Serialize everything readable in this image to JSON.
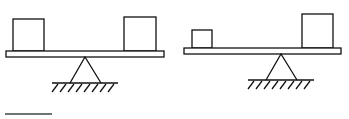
{
  "diagram": {
    "colors": {
      "stroke": "#111111",
      "background": "#ffffff"
    },
    "scenes": [
      {
        "name": "balanced-seesaw",
        "beam": {
          "x": 6,
          "y": 51,
          "w": 158,
          "h": 6
        },
        "left_box": {
          "x": 13,
          "y": 19,
          "w": 31,
          "h": 32
        },
        "right_box": {
          "x": 124,
          "y": 17,
          "w": 32,
          "h": 34
        },
        "fulcrum": {
          "apex_x": 85,
          "apex_y": 57,
          "base_left": 70,
          "base_right": 101,
          "base_y": 83
        },
        "ground": {
          "x1": 52,
          "x2": 118,
          "y": 83
        }
      },
      {
        "name": "unequal-seesaw",
        "beam": {
          "x": 184,
          "y": 48,
          "w": 157,
          "h": 6
        },
        "left_box": {
          "x": 192,
          "y": 30,
          "w": 20,
          "h": 18
        },
        "right_box": {
          "x": 302,
          "y": 14,
          "w": 31,
          "h": 34
        },
        "fulcrum": {
          "apex_x": 281,
          "apex_y": 54,
          "base_left": 266,
          "base_right": 297,
          "base_y": 80
        },
        "ground": {
          "x1": 248,
          "x2": 314,
          "y": 80
        }
      }
    ],
    "underline": {
      "x1": 5,
      "x2": 52,
      "y": 114
    }
  }
}
